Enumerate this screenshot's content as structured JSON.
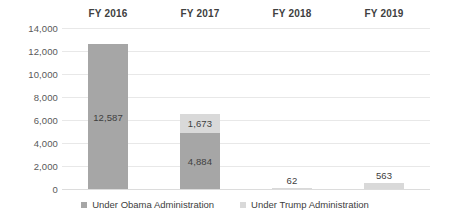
{
  "chart_data": {
    "type": "bar",
    "subtype": "stacked-bar",
    "title": "",
    "subtitle": "",
    "xlabel": "",
    "ylabel": "",
    "categories": [
      "FY 2016",
      "FY 2017",
      "FY 2018",
      "FY 2019"
    ],
    "category_label_position": "top",
    "series": [
      {
        "name": "Under Obama Administration",
        "color": "#a6a6a6",
        "values": [
          12587,
          4884,
          0,
          0
        ],
        "labels": [
          "12,587",
          "4,884",
          "",
          ""
        ]
      },
      {
        "name": "Under Trump Administration",
        "color": "#d9d9d9",
        "values": [
          0,
          1673,
          62,
          563
        ],
        "labels": [
          "",
          "1,673",
          "62",
          "563"
        ]
      }
    ],
    "totals": [
      12587,
      6557,
      62,
      563
    ],
    "ylim": [
      0,
      14000
    ],
    "ytick_step": 2000,
    "ytick_labels": [
      "14,000",
      "12,000",
      "10,000",
      "8,000",
      "6,000",
      "4,000",
      "2,000",
      "0"
    ],
    "ytick_values": [
      14000,
      12000,
      10000,
      8000,
      6000,
      4000,
      2000,
      0
    ],
    "grid": true,
    "legend_position": "bottom",
    "legend": [
      {
        "label": "Under Obama Administration",
        "color": "#a6a6a6"
      },
      {
        "label": "Under Trump Administration",
        "color": "#d9d9d9"
      }
    ]
  }
}
